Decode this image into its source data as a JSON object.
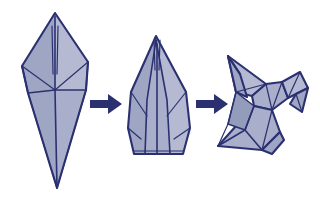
{
  "illustration": {
    "title": "Origami crane folding sequence",
    "subject": "paper crane (orizuru)",
    "medium": "line drawing with flat color fill",
    "background_color": "#ffffff",
    "outline_color": "#2b3170",
    "paper_fill_color": "#a9aecb",
    "paper_fill_shadow_color": "#949cbc",
    "paper_fill_highlight_color": "#b5b9d2",
    "arrow_color": "#2b3170",
    "step_count": 3,
    "arrow_count": 2,
    "reading_direction": "left-to-right",
    "steps": [
      {
        "index": 1,
        "name": "bird-base-elongated",
        "label": "",
        "description": "Tall narrow diamond with a vertical center crease and a wide V-shaped fold across the middle"
      },
      {
        "index": 2,
        "name": "narrowed-base-with-thin-flaps",
        "label": "",
        "description": "Shorter blunt form with a flat base, thin pointed flaps raised at the top and side creases"
      },
      {
        "index": 3,
        "name": "finished-paper-crane",
        "label": "",
        "description": "Completed crane with head and beak on the left, swept wings and a pointed tail on the right"
      }
    ],
    "arrows": [
      {
        "index": 1,
        "name": "step-arrow-1",
        "direction": "right",
        "label": ""
      },
      {
        "index": 2,
        "name": "step-arrow-2",
        "direction": "right",
        "label": ""
      }
    ]
  }
}
